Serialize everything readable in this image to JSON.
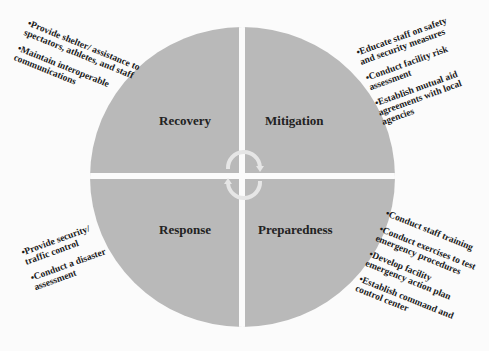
{
  "diagram": {
    "type": "cycle-quadrant-diagram",
    "colors": {
      "quadrant_fill": "#b9b9b9",
      "background": "#fbfbfb",
      "arrow": "#e6e6e6",
      "text": "#1a1a1a"
    },
    "quadrants": {
      "recovery": {
        "label": "Recovery",
        "notes": [
          "Provide shelter/ assistance to spectators, athletes, and staff",
          "Maintain interoperable communications"
        ]
      },
      "mitigation": {
        "label": "Mitigation",
        "notes": [
          "Educate staff on safety and security measures",
          "Conduct facility risk assessment",
          "Establish mutual aid agreements with local agencies"
        ]
      },
      "response": {
        "label": "Response",
        "notes": [
          "Provide security/ traffic control",
          "Conduct a disaster assessment"
        ]
      },
      "preparedness": {
        "label": "Preparedness",
        "notes": [
          "Conduct staff training",
          "Conduct exercises to test emergency procedures",
          "Develop facility emergency action plan",
          "Establish command and control center"
        ]
      }
    },
    "center_icon": "cycle-arrows-icon"
  }
}
